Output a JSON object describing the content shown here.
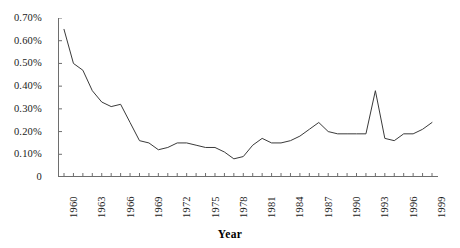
{
  "chart_data": {
    "type": "line",
    "title": "",
    "subtitle": "",
    "xlabel": "Year",
    "ylabel": "",
    "grid": false,
    "legend": "none",
    "xlim": [
      1960,
      1999
    ],
    "ylim": [
      0,
      0.007
    ],
    "y_tick_labels": [
      "0.70%",
      "0.60%",
      "0.50%",
      "0.40%",
      "0.30%",
      "0.20%",
      "0.10%",
      "0"
    ],
    "y_tick_values": [
      0.7,
      0.6,
      0.5,
      0.4,
      0.3,
      0.2,
      0.1,
      0
    ],
    "y_unit": "%",
    "x_tick_labels": [
      "1960",
      "1963",
      "1966",
      "1969",
      "1972",
      "1975",
      "1978",
      "1981",
      "1984",
      "1987",
      "1990",
      "1993",
      "1996",
      "1999"
    ],
    "x_tick_interval": 3,
    "x_minor_tick_interval": 1,
    "series": [
      {
        "name": "value",
        "color": "#3a3a3a",
        "x": [
          1960,
          1961,
          1962,
          1963,
          1964,
          1965,
          1966,
          1967,
          1968,
          1969,
          1970,
          1971,
          1972,
          1973,
          1974,
          1975,
          1976,
          1977,
          1978,
          1979,
          1980,
          1981,
          1982,
          1983,
          1984,
          1985,
          1986,
          1987,
          1988,
          1989,
          1990,
          1991,
          1992,
          1993,
          1994,
          1995,
          1996,
          1997,
          1998,
          1999
        ],
        "values": [
          0.65,
          0.5,
          0.47,
          0.38,
          0.33,
          0.31,
          0.32,
          0.24,
          0.16,
          0.15,
          0.12,
          0.13,
          0.15,
          0.15,
          0.14,
          0.13,
          0.13,
          0.11,
          0.08,
          0.09,
          0.14,
          0.17,
          0.15,
          0.15,
          0.16,
          0.18,
          0.21,
          0.24,
          0.2,
          0.19,
          0.19,
          0.19,
          0.19,
          0.38,
          0.17,
          0.16,
          0.19,
          0.19,
          0.21,
          0.24
        ]
      }
    ]
  },
  "axis": {
    "title": "Year"
  },
  "colors": {
    "line": "#3a3a3a",
    "axis": "#6e6e6e",
    "text": "#1a1a1a",
    "background": "#ffffff"
  }
}
